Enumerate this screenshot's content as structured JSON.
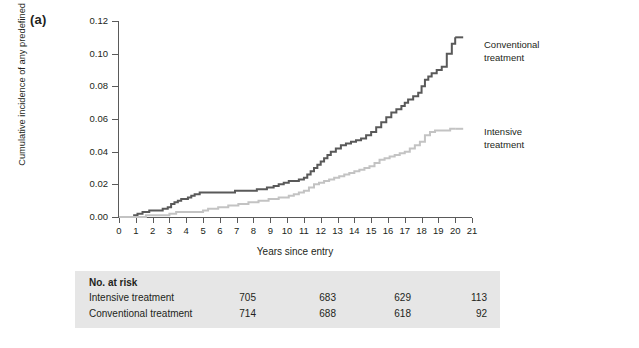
{
  "panel": {
    "label": "(a)"
  },
  "legend": {
    "conventional": "Conventional\ntreatment",
    "conventional_line1": "Conventional",
    "conventional_line2": "treatment",
    "intensive_line1": "Intensive",
    "intensive_line2": "treatment"
  },
  "colors": {
    "conventional": "#595959",
    "intensive": "#c3c3c3",
    "axis": "#5a5a5a",
    "table_background": "#e6e6e6",
    "text": "#231f20"
  },
  "risk_table": {
    "title": "No. at risk",
    "rows": [
      {
        "name": "Intensive treatment",
        "values": [
          "705",
          "683",
          "629",
          "113"
        ]
      },
      {
        "name": "Conventional treatment",
        "values": [
          "714",
          "688",
          "618",
          "92"
        ]
      }
    ]
  },
  "chart_data": {
    "type": "line",
    "title": "",
    "xlabel": "Years since entry",
    "ylabel": "Cumulative incidence of any predefined cardiovascular outcome",
    "xlim": [
      0,
      21
    ],
    "ylim": [
      0.0,
      0.12
    ],
    "xticks": [
      0,
      1,
      2,
      3,
      4,
      5,
      6,
      7,
      8,
      9,
      10,
      11,
      12,
      13,
      14,
      15,
      16,
      17,
      18,
      19,
      20,
      21
    ],
    "xtick_labels": [
      "0",
      "1",
      "2",
      "3",
      "4",
      "5",
      "6",
      "7",
      "8",
      "9",
      "10",
      "11",
      "12",
      "13",
      "14",
      "15",
      "16",
      "17",
      "18",
      "19",
      "20",
      "21"
    ],
    "yticks": [
      0.0,
      0.02,
      0.04,
      0.06,
      0.08,
      0.1,
      0.12
    ],
    "ytick_labels": [
      "0.00",
      "0.02",
      "0.04",
      "0.06",
      "0.08",
      "0.10",
      "0.12"
    ],
    "grid": false,
    "legend_position": "right-inline",
    "step": "post",
    "series": [
      {
        "name": "Conventional treatment",
        "color": "#595959",
        "x": [
          0,
          0.6,
          0.9,
          1.1,
          1.4,
          1.8,
          2.2,
          2.6,
          2.9,
          3.1,
          3.3,
          3.5,
          3.7,
          3.9,
          4.1,
          4.3,
          4.5,
          4.8,
          5.0,
          5.4,
          5.9,
          6.4,
          6.9,
          7.4,
          7.9,
          8.2,
          8.5,
          8.8,
          9.0,
          9.2,
          9.5,
          9.8,
          10.1,
          10.4,
          10.7,
          11.0,
          11.2,
          11.4,
          11.6,
          11.8,
          12.0,
          12.2,
          12.4,
          12.6,
          12.9,
          13.2,
          13.5,
          13.8,
          14.1,
          14.4,
          14.7,
          15.0,
          15.3,
          15.6,
          15.9,
          16.2,
          16.5,
          16.8,
          17.0,
          17.2,
          17.5,
          17.8,
          18.0,
          18.2,
          18.4,
          18.6,
          18.9,
          19.2,
          19.5,
          19.8,
          20.0
        ],
        "y": [
          0.0,
          0.0,
          0.001,
          0.002,
          0.003,
          0.004,
          0.004,
          0.005,
          0.006,
          0.008,
          0.009,
          0.01,
          0.011,
          0.011,
          0.012,
          0.013,
          0.014,
          0.015,
          0.015,
          0.015,
          0.015,
          0.015,
          0.016,
          0.016,
          0.016,
          0.017,
          0.017,
          0.018,
          0.018,
          0.019,
          0.02,
          0.021,
          0.022,
          0.022,
          0.023,
          0.024,
          0.026,
          0.028,
          0.03,
          0.032,
          0.034,
          0.036,
          0.038,
          0.04,
          0.042,
          0.044,
          0.045,
          0.046,
          0.047,
          0.048,
          0.05,
          0.052,
          0.055,
          0.058,
          0.061,
          0.064,
          0.066,
          0.068,
          0.07,
          0.072,
          0.074,
          0.076,
          0.08,
          0.084,
          0.086,
          0.088,
          0.09,
          0.092,
          0.1,
          0.106,
          0.11
        ]
      },
      {
        "name": "Intensive treatment",
        "color": "#c3c3c3",
        "x": [
          0,
          0.8,
          1.2,
          1.6,
          2.0,
          2.5,
          3.0,
          3.4,
          3.8,
          4.2,
          4.6,
          5.0,
          5.3,
          5.6,
          5.9,
          6.2,
          6.5,
          6.8,
          7.1,
          7.4,
          7.7,
          8.0,
          8.3,
          8.6,
          8.9,
          9.2,
          9.5,
          9.8,
          10.1,
          10.4,
          10.7,
          11.0,
          11.3,
          11.6,
          11.9,
          12.2,
          12.5,
          12.8,
          13.1,
          13.4,
          13.7,
          14.0,
          14.3,
          14.6,
          14.9,
          15.2,
          15.5,
          15.8,
          16.1,
          16.4,
          16.7,
          17.0,
          17.3,
          17.6,
          17.9,
          18.2,
          18.5,
          18.8,
          19.1,
          19.4,
          19.7,
          20.0
        ],
        "y": [
          0.0,
          0.0,
          0.0,
          0.001,
          0.001,
          0.001,
          0.002,
          0.003,
          0.003,
          0.003,
          0.003,
          0.004,
          0.005,
          0.005,
          0.006,
          0.006,
          0.007,
          0.007,
          0.008,
          0.008,
          0.009,
          0.009,
          0.01,
          0.01,
          0.011,
          0.011,
          0.012,
          0.012,
          0.013,
          0.014,
          0.015,
          0.016,
          0.018,
          0.02,
          0.021,
          0.022,
          0.023,
          0.024,
          0.025,
          0.026,
          0.027,
          0.028,
          0.029,
          0.03,
          0.031,
          0.033,
          0.035,
          0.036,
          0.037,
          0.038,
          0.039,
          0.04,
          0.042,
          0.044,
          0.046,
          0.05,
          0.052,
          0.053,
          0.053,
          0.053,
          0.054,
          0.054
        ]
      }
    ]
  }
}
